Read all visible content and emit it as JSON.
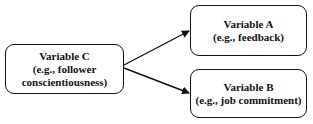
{
  "nodes": {
    "c": {
      "title": "Variable C",
      "line2": "(e.g., follower",
      "line3": "conscientiousness)"
    },
    "a": {
      "title": "Variable A",
      "line2": "(e.g., feedback)"
    },
    "b": {
      "title": "Variable B",
      "line2": "(e.g., job commitment)"
    }
  },
  "edges": [
    {
      "from": "Variable C",
      "to": "Variable A"
    },
    {
      "from": "Variable C",
      "to": "Variable B"
    }
  ],
  "colors": {
    "stroke": "#111111",
    "background": "#ffffff"
  }
}
